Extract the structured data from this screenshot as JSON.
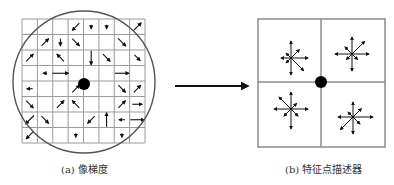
{
  "figure": {
    "left_panel": {
      "caption": "(a) 像梯度",
      "grid": {
        "cols": 8,
        "rows": 8,
        "x0": 22,
        "y0": 19,
        "x1": 145,
        "y1": 143,
        "line_color": "#9a9a9a"
      },
      "circle": {
        "cx": 84,
        "cy": 82,
        "r": 71,
        "stroke": "#555555"
      },
      "keypoint": {
        "cx": 84,
        "cy": 84,
        "r": 6,
        "fill": "#000000"
      },
      "gradients": [
        {
          "col": 3,
          "row": 0,
          "angle": 225,
          "len": 10
        },
        {
          "col": 4,
          "row": 0,
          "angle": 270,
          "len": 4
        },
        {
          "col": 5,
          "row": 0,
          "angle": 270,
          "len": 4
        },
        {
          "col": 7,
          "row": 0,
          "angle": 45,
          "len": 11
        },
        {
          "col": 1,
          "row": 1,
          "angle": 45,
          "len": 10
        },
        {
          "col": 2,
          "row": 1,
          "angle": 270,
          "len": 7
        },
        {
          "col": 3,
          "row": 1,
          "angle": 315,
          "len": 10
        },
        {
          "col": 6,
          "row": 1,
          "angle": 315,
          "len": 11
        },
        {
          "col": 0,
          "row": 2,
          "angle": 45,
          "len": 10
        },
        {
          "col": 2,
          "row": 2,
          "angle": 135,
          "len": 10
        },
        {
          "col": 4,
          "row": 2,
          "angle": 270,
          "len": 14
        },
        {
          "col": 5,
          "row": 2,
          "angle": 315,
          "len": 10
        },
        {
          "col": 7,
          "row": 2,
          "angle": 315,
          "len": 8
        },
        {
          "col": 2,
          "row": 3,
          "angle": 0,
          "len": 16
        },
        {
          "col": 1,
          "row": 3,
          "angle": 180,
          "len": 0
        },
        {
          "col": 6,
          "row": 3,
          "angle": 0,
          "len": 14
        },
        {
          "col": 0,
          "row": 4,
          "angle": 180,
          "len": 6
        },
        {
          "col": 3,
          "row": 4,
          "angle": 45,
          "len": 10
        },
        {
          "col": 6,
          "row": 4,
          "angle": 315,
          "len": 10
        },
        {
          "col": 7,
          "row": 4,
          "angle": 45,
          "len": 10
        },
        {
          "col": 0,
          "row": 5,
          "angle": 315,
          "len": 10
        },
        {
          "col": 2,
          "row": 5,
          "angle": 45,
          "len": 10
        },
        {
          "col": 3,
          "row": 5,
          "angle": 135,
          "len": 10
        },
        {
          "col": 6,
          "row": 5,
          "angle": 45,
          "len": 10
        },
        {
          "col": 7,
          "row": 5,
          "angle": 0,
          "len": 10
        },
        {
          "col": 0,
          "row": 6,
          "angle": 225,
          "len": 12
        },
        {
          "col": 1,
          "row": 6,
          "angle": 315,
          "len": 10
        },
        {
          "col": 4,
          "row": 6,
          "angle": 225,
          "len": 10
        },
        {
          "col": 5,
          "row": 6,
          "angle": 90,
          "len": 14
        },
        {
          "col": 7,
          "row": 6,
          "angle": 0,
          "len": 14
        },
        {
          "col": 6,
          "row": 6,
          "angle": 180,
          "len": 6
        },
        {
          "col": 0,
          "row": 7,
          "angle": 225,
          "len": 10
        },
        {
          "col": 3,
          "row": 7,
          "angle": 270,
          "len": 4
        },
        {
          "col": 6,
          "row": 7,
          "angle": 270,
          "len": 4
        },
        {
          "col": 8,
          "row": 7,
          "angle": 270,
          "len": 4
        },
        {
          "col": 2,
          "row": 8,
          "angle": 315,
          "len": 10
        },
        {
          "col": 3,
          "row": 8,
          "angle": 270,
          "len": 4
        },
        {
          "col": 5,
          "row": 8,
          "angle": 270,
          "len": 4
        },
        {
          "col": 7,
          "row": 8,
          "angle": 135,
          "len": 10
        }
      ]
    },
    "transition_arrow": {
      "x1": 175,
      "y1": 86,
      "x2": 248,
      "y2": 86,
      "stroke": "#111111"
    },
    "right_panel": {
      "caption": "(b) 特征点描述器",
      "box": {
        "x0": 258,
        "y0": 19,
        "x1": 385,
        "y1": 147,
        "stroke": "#8a8a8a"
      },
      "center": {
        "x": 321,
        "y": 82
      },
      "keypoint": {
        "cx": 321,
        "cy": 82,
        "r": 6,
        "fill": "#000000"
      },
      "descriptors": [
        {
          "quadrant": "top-left",
          "cx": 291,
          "cy": 58,
          "lengths": [
            17,
            12,
            17,
            7,
            10,
            7,
            17,
            18
          ]
        },
        {
          "quadrant": "top-right",
          "cx": 352,
          "cy": 54,
          "lengths": [
            17,
            18,
            17,
            10,
            17,
            8,
            17,
            8
          ]
        },
        {
          "quadrant": "bottom-left",
          "cx": 291,
          "cy": 109,
          "lengths": [
            17,
            8,
            17,
            17,
            17,
            10,
            20,
            10
          ]
        },
        {
          "quadrant": "bottom-right",
          "cx": 353,
          "cy": 117,
          "lengths": [
            20,
            12,
            15,
            7,
            15,
            18,
            17,
            10
          ]
        }
      ]
    }
  }
}
